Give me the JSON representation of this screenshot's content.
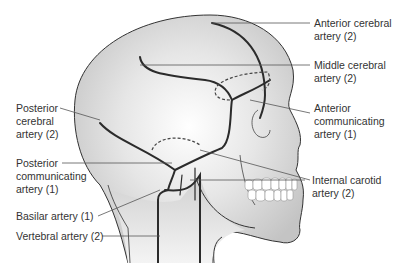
{
  "figure": {
    "labels": [
      {
        "id": "anterior-cerebral",
        "text": "Anterior cerebral\nartery (2)"
      },
      {
        "id": "middle-cerebral",
        "text": "Middle cerebral\nartery (2)"
      },
      {
        "id": "anterior-communicating",
        "text": "Anterior\ncommunicating\nartery (1)"
      },
      {
        "id": "internal-carotid",
        "text": "Internal carotid\nartery (2)"
      },
      {
        "id": "posterior-cerebral",
        "text": "Posterior\ncerebral\nartery (2)"
      },
      {
        "id": "posterior-communicating",
        "text": "Posterior\ncommunicating\nartery (1)"
      },
      {
        "id": "basilar",
        "text": "Basilar artery (1)"
      },
      {
        "id": "vertebral",
        "text": "Vertebral artery (2)"
      }
    ]
  }
}
